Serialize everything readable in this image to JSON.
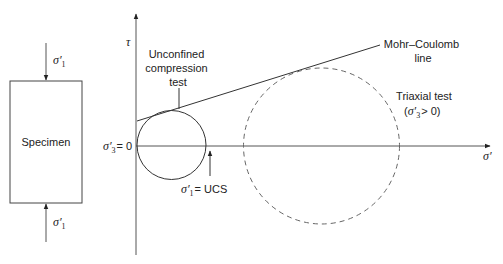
{
  "diagram": {
    "specimen": {
      "label": "Specimen",
      "top_load": {
        "symbol": "σ′",
        "subscript": "1"
      },
      "bottom_load": {
        "symbol": "σ′",
        "subscript": "1"
      }
    },
    "axes": {
      "y_label": "τ",
      "x_label": "σ′",
      "origin_label": {
        "symbol": "σ′",
        "subscript": "3",
        "suffix": "= 0"
      }
    },
    "unconfined": {
      "label_lines": [
        "Unconfined",
        "compression",
        "test"
      ],
      "ucs_label": {
        "symbol": "σ′",
        "subscript": "1",
        "suffix": "= UCS"
      }
    },
    "mohr_coulomb": {
      "label_lines": [
        "Mohr–Coulomb",
        "line"
      ]
    },
    "triaxial": {
      "label_line1": "Triaxial test",
      "label_line2": {
        "open": "(",
        "symbol": "σ′",
        "subscript": "3",
        "suffix": "> 0)"
      }
    },
    "colors": {
      "stroke": "#333333",
      "dashed": "#555555",
      "text": "#222222"
    }
  }
}
